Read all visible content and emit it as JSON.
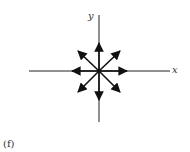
{
  "diagram": {
    "axis_labels": {
      "x": "x",
      "y": "y"
    },
    "caption": "(f)",
    "center": [
      99,
      71
    ],
    "arrow_directions_deg": [
      0,
      45,
      90,
      135,
      180,
      225,
      270,
      315
    ]
  }
}
